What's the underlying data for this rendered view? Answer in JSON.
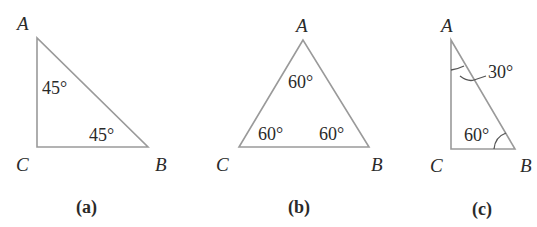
{
  "figures": [
    {
      "id": "a",
      "caption": "(a)",
      "vertices": {
        "A": "A",
        "B": "B",
        "C": "C"
      },
      "angles": {
        "A": "45°",
        "B": "45°",
        "C": "90°"
      },
      "angle_labels": [
        "45°",
        "45°"
      ]
    },
    {
      "id": "b",
      "caption": "(b)",
      "vertices": {
        "A": "A",
        "B": "B",
        "C": "C"
      },
      "angles": {
        "A": "60°",
        "B": "60°",
        "C": "60°"
      },
      "angle_labels": [
        "60°",
        "60°",
        "60°"
      ]
    },
    {
      "id": "c",
      "caption": "(c)",
      "vertices": {
        "A": "A",
        "B": "B",
        "C": "C"
      },
      "angles": {
        "A": "30°",
        "B": "60°",
        "C": "90°"
      },
      "angle_labels": [
        "30°",
        "60°"
      ]
    }
  ],
  "colors": {
    "edge": "#9a9a9a",
    "text": "#2a2a2a",
    "background": "#ffffff"
  }
}
